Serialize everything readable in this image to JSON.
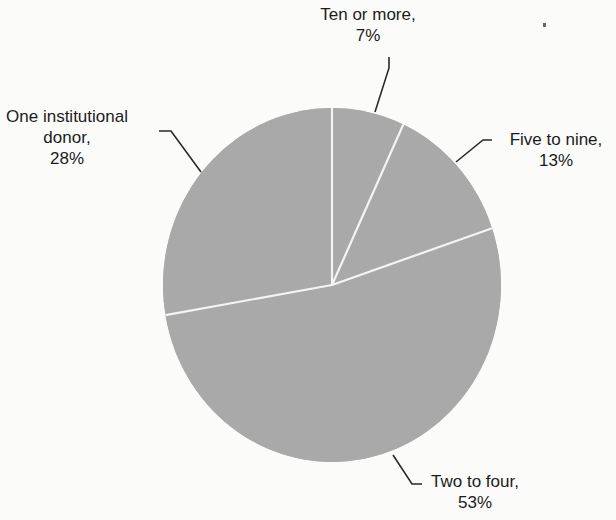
{
  "chart_data": {
    "type": "pie",
    "title": "",
    "slices": [
      {
        "label": "Ten or more",
        "value": 7
      },
      {
        "label": "Five to nine",
        "value": 13
      },
      {
        "label": "Two to four",
        "value": 53
      },
      {
        "label": "One institutional donor",
        "value": 28
      }
    ],
    "start_angle_deg": 0,
    "direction": "clockwise",
    "units": "%",
    "legend": "none (direct labels with leader lines)",
    "colors": {
      "fill": "#a9a9a9",
      "divider": "#f4f4f4",
      "text": "#1b1b1b",
      "leader": "#2a2a2a"
    }
  },
  "labels": {
    "ten_or_more": {
      "line1": "Ten or more,",
      "line2": "7%"
    },
    "five_to_nine": {
      "line1": "Five to nine,",
      "line2": "13%"
    },
    "two_to_four": {
      "line1": "Two to four,",
      "line2": "53%"
    },
    "one_donor": {
      "line1": "One institutional",
      "line2": "donor,",
      "line3": "28%"
    }
  }
}
